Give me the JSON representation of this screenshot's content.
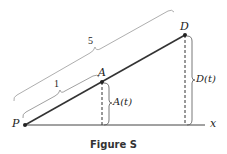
{
  "figure": {
    "caption": "Figure S",
    "points": {
      "P": {
        "label": "P",
        "x": 25,
        "y": 125
      },
      "A": {
        "label": "A",
        "x": 102,
        "y": 82
      },
      "D": {
        "label": "D",
        "x": 185,
        "y": 35
      }
    },
    "axis_label": "x",
    "brace_labels": {
      "PA_length": "1",
      "PD_length": "5",
      "A_height": "A(t)",
      "D_height": "D(t)"
    },
    "colors": {
      "line": "#333333",
      "brace": "#999999",
      "text": "#222222"
    }
  }
}
